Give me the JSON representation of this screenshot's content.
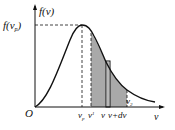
{
  "diagram": {
    "y_axis_label": "f(v)",
    "x_axis_label": "v",
    "origin_label": "O",
    "peak_label": "f(v_p)",
    "peak_label_main": "f(v",
    "peak_label_sub": "p",
    "peak_label_close": ")",
    "x_ticks": [
      {
        "main": "v",
        "sub": "p"
      },
      {
        "main": "v",
        "sub": "1"
      },
      {
        "main": "v",
        "sub": ""
      },
      {
        "main": "v+dv",
        "sub": ""
      }
    ],
    "v2_label": {
      "main": "v",
      "sub": "2"
    },
    "colors": {
      "curve": "#111111",
      "shade": "#a9a9a9",
      "axis": "#111111"
    }
  }
}
